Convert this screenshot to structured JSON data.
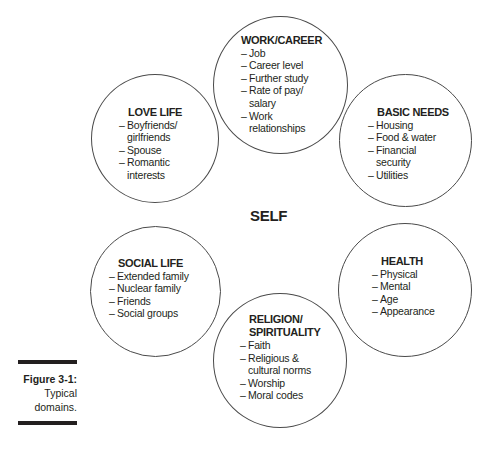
{
  "center_label": "SELF",
  "domains": [
    {
      "key": "work",
      "title": "WORK/CAREER",
      "items": [
        "Job",
        "Career level",
        "Further study",
        "Rate of pay/\nsalary",
        "Work\nrelationships"
      ]
    },
    {
      "key": "love",
      "title": "LOVE LIFE",
      "items": [
        "Boyfriends/\ngirlfriends",
        "Spouse",
        "Romantic\ninterests"
      ]
    },
    {
      "key": "basic",
      "title": "BASIC NEEDS",
      "items": [
        "Housing",
        "Food & water",
        "Financial\nsecurity",
        "Utilities"
      ]
    },
    {
      "key": "social",
      "title": "SOCIAL LIFE",
      "items": [
        "Extended family",
        "Nuclear family",
        "Friends",
        "Social groups"
      ]
    },
    {
      "key": "health",
      "title": "HEALTH",
      "items": [
        "Physical",
        "Mental",
        "Age",
        "Appearance"
      ]
    },
    {
      "key": "religion",
      "title": "RELIGION/\nSPIRITUALITY",
      "items": [
        "Faith",
        "Religious &\ncultural norms",
        "Worship",
        "Moral codes"
      ]
    }
  ],
  "caption": {
    "figure": "Figure 3-1:",
    "line1": "Typical",
    "line2": "domains."
  },
  "colors": {
    "stroke": "#4a4a4a",
    "text": "#231f20",
    "background": "#ffffff"
  }
}
